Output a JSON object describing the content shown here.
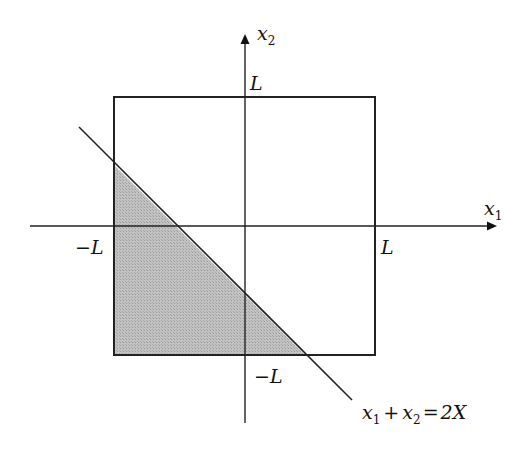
{
  "diagram": {
    "type": "region-plot",
    "colors": {
      "stroke": "#222222",
      "shade": "#b4b4b4",
      "background": "#ffffff"
    },
    "axes": {
      "x_label": "x",
      "x_label_sub": "1",
      "y_label": "x",
      "y_label_sub": "2"
    },
    "square": {
      "half_side_label": "L",
      "ticks": {
        "x_neg": "−L",
        "x_pos": "L",
        "y_pos": "L",
        "y_neg": "−L"
      }
    },
    "line": {
      "equation": "x1 + x2 = 2X",
      "parts": {
        "a": "x",
        "a_sub": "1",
        "plus": "+",
        "b": "x",
        "b_sub": "2",
        "equals": "=",
        "rhs": "2X"
      }
    },
    "shaded_region": "square ∩ {x1 + x2 < 2X}"
  }
}
